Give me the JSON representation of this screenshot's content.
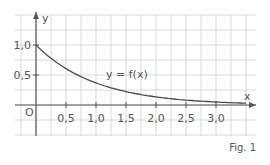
{
  "chart_data": {
    "type": "line",
    "title": "",
    "xlabel": "x",
    "ylabel": "y",
    "origin_label": "O",
    "curve_label": "y = f(x)",
    "figure_caption": "Fig. 1",
    "x_ticks": [
      0.5,
      1.0,
      1.5,
      2.0,
      2.5,
      3.0
    ],
    "x_tick_labels": [
      "0,5",
      "1,0",
      "1,5",
      "2,0",
      "2,5",
      "3,0"
    ],
    "y_ticks": [
      0.5,
      1.0
    ],
    "y_tick_labels": [
      "0,5",
      "1,0"
    ],
    "xlim": [
      -0.35,
      3.65
    ],
    "ylim": [
      -0.5,
      1.5
    ],
    "grid": true,
    "series": [
      {
        "name": "y = f(x)",
        "x": [
          0,
          0.25,
          0.5,
          0.75,
          1.0,
          1.25,
          1.5,
          1.75,
          2.0,
          2.25,
          2.5,
          2.75,
          3.0,
          3.25,
          3.5
        ],
        "values": [
          1.0,
          0.78,
          0.61,
          0.47,
          0.37,
          0.29,
          0.22,
          0.17,
          0.14,
          0.11,
          0.08,
          0.06,
          0.05,
          0.04,
          0.03
        ]
      }
    ]
  },
  "colors": {
    "grid": "#d9d9d9",
    "axis": "#555555",
    "curve": "#4a4a4a",
    "text": "#555555"
  }
}
